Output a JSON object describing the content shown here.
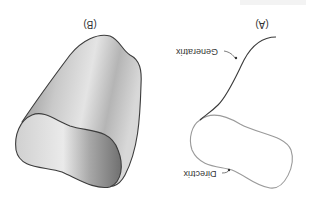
{
  "figure": {
    "orientation": "rotated 180 degrees",
    "panels": [
      {
        "id": "A",
        "label": "(A)",
        "callouts": [
          {
            "name": "generatrix",
            "label": "Generatrix"
          },
          {
            "name": "directrix",
            "label": "Directrix"
          }
        ]
      },
      {
        "id": "B",
        "label": "(B)"
      }
    ],
    "colors": {
      "generatrix_line": "#3a3a3a",
      "directrix_line": "#9a9a9a",
      "surface_dark": "#6e6e6e",
      "surface_light": "#e2e2e2",
      "outline": "#3c3c3c",
      "text": "#333333"
    }
  }
}
